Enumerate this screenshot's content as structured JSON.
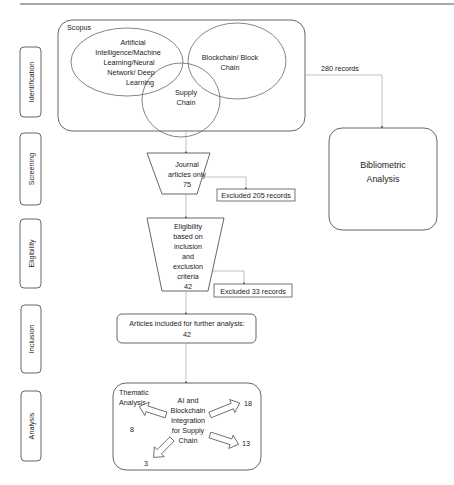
{
  "stages": [
    {
      "label": "Identification"
    },
    {
      "label": "Screening"
    },
    {
      "label": "Eligibility"
    },
    {
      "label": "Inclusion"
    },
    {
      "label": "Analysis"
    }
  ],
  "identification": {
    "source": "Scopus",
    "venn": {
      "ai": [
        "Artificial",
        "Intelligence/Machine",
        "Learning/Neural",
        "Network/ Deep",
        "Learning"
      ],
      "blockchain": [
        "Blockchain/ Block",
        "Chain"
      ],
      "supply_chain": [
        "Supply",
        "Chain"
      ],
      "intersection_color": "#555555"
    },
    "records_label": "280 records"
  },
  "bibliometric": {
    "lines": [
      "Bibliometric",
      "Analysis"
    ]
  },
  "screening": {
    "lines": [
      "Journal",
      "articles only",
      "75"
    ],
    "excluded": "Excluded 205 records"
  },
  "eligibility": {
    "lines": [
      "Eligibility",
      "based on",
      "inclusion",
      "and",
      "exclusion",
      "criteria",
      "42"
    ],
    "excluded": "Excluded 33 records"
  },
  "inclusion": {
    "lines": [
      "Articles included for further analysis:",
      "42"
    ]
  },
  "analysis": {
    "title": [
      "Thematic",
      "Analysis"
    ],
    "center": [
      "AI and",
      "Blockchain",
      "Integration",
      "for Supply",
      "Chain"
    ],
    "branches": [
      {
        "direction": "up-right",
        "value": "18"
      },
      {
        "direction": "left",
        "value": "8"
      },
      {
        "direction": "down-right",
        "value": "13"
      },
      {
        "direction": "down-left",
        "value": "3"
      }
    ]
  }
}
